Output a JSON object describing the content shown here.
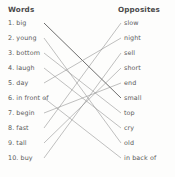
{
  "worksheet": {
    "headers": {
      "left": "Words",
      "right": "Opposites"
    },
    "words": [
      {
        "num": "1.",
        "label": "big",
        "y": 23
      },
      {
        "num": "2.",
        "label": "young",
        "y": 38
      },
      {
        "num": "3.",
        "label": "bottom",
        "y": 53
      },
      {
        "num": "4.",
        "label": "laugh",
        "y": 68
      },
      {
        "num": "5.",
        "label": "day",
        "y": 83
      },
      {
        "num": "6.",
        "label": "in front of",
        "y": 98
      },
      {
        "num": "7.",
        "label": "begin",
        "y": 113
      },
      {
        "num": "8.",
        "label": "fast",
        "y": 128
      },
      {
        "num": "9.",
        "label": "tall",
        "y": 143
      },
      {
        "num": "10.",
        "label": "buy",
        "y": 158
      }
    ],
    "opposites": [
      {
        "label": "slow",
        "y": 23
      },
      {
        "label": "night",
        "y": 38
      },
      {
        "label": "sell",
        "y": 53
      },
      {
        "label": "short",
        "y": 68
      },
      {
        "label": "end",
        "y": 83
      },
      {
        "label": "small",
        "y": 98
      },
      {
        "label": "top",
        "y": 113
      },
      {
        "label": "cry",
        "y": 128
      },
      {
        "label": "old",
        "y": 143
      },
      {
        "label": "in back of",
        "y": 158
      }
    ],
    "matches": [
      {
        "from": "big",
        "to": "small",
        "from_index": 0,
        "to_index": 5,
        "emphasis": true
      },
      {
        "from": "young",
        "to": "old",
        "from_index": 1,
        "to_index": 8,
        "emphasis": false
      },
      {
        "from": "bottom",
        "to": "top",
        "from_index": 2,
        "to_index": 6,
        "emphasis": false
      },
      {
        "from": "laugh",
        "to": "cry",
        "from_index": 3,
        "to_index": 7,
        "emphasis": false
      },
      {
        "from": "day",
        "to": "night",
        "from_index": 4,
        "to_index": 1,
        "emphasis": false
      },
      {
        "from": "in front of",
        "to": "in back of",
        "from_index": 5,
        "to_index": 9,
        "emphasis": false
      },
      {
        "from": "begin",
        "to": "end",
        "from_index": 6,
        "to_index": 4,
        "emphasis": false
      },
      {
        "from": "fast",
        "to": "slow",
        "from_index": 7,
        "to_index": 0,
        "emphasis": false
      },
      {
        "from": "tall",
        "to": "short",
        "from_index": 8,
        "to_index": 3,
        "emphasis": false
      },
      {
        "from": "buy",
        "to": "sell",
        "from_index": 9,
        "to_index": 2,
        "emphasis": false
      }
    ],
    "geometry": {
      "left_anchor_x": 44,
      "right_anchor_x": 121,
      "line_color": "#8c8c8c",
      "emphasis_color": "#3d3d3d"
    }
  }
}
